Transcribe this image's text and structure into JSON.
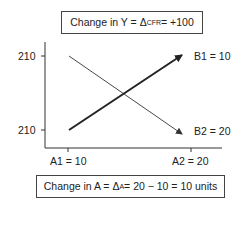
{
  "top_box": {
    "prefix": "Change in Y = Δ",
    "subscript": "CFR",
    "suffix": " = +100"
  },
  "bottom_box": {
    "prefix": "Change in A = Δ",
    "subscript": "A",
    "suffix": " = 20 − 10 = 10 units"
  },
  "y_axis": {
    "ticks": [
      {
        "label": "210"
      },
      {
        "label": "210"
      }
    ]
  },
  "x_axis": {
    "ticks": [
      {
        "label": "A1 = 10"
      },
      {
        "label": "A2 = 20"
      }
    ]
  },
  "lines": [
    {
      "name": "B1",
      "label": "B1 = 10",
      "style": "thick",
      "from": "A1 bottom",
      "to": "A2 top"
    },
    {
      "name": "B2",
      "label": "B2 = 20",
      "style": "thin",
      "from": "A1 top",
      "to": "A2 bottom"
    }
  ],
  "colors": {
    "line": "#222222",
    "axis": "#333333",
    "box_border": "#444444"
  }
}
